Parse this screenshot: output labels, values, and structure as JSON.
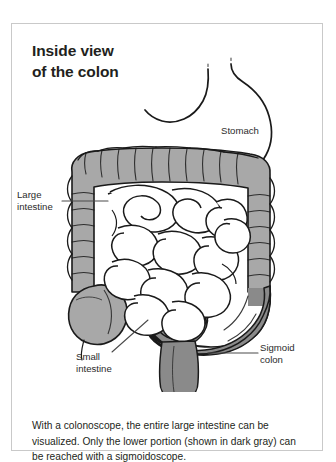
{
  "figure": {
    "title": "Inside view\nof the colon",
    "caption": "With a colonoscope, the entire large intestine can be visualized. Only the lower portion (shown in dark gray) can be reached with a sigmoidoscope.",
    "border_color": "#c9c9c9",
    "background_color": "#ffffff"
  },
  "labels": {
    "stomach": "Stomach",
    "large_intestine": "Large\nintestine",
    "small_intestine": "Small\nintestine",
    "sigmoid_colon": "Sigmoid\ncolon"
  },
  "colors": {
    "colon_light_gray": "#a8a8a8",
    "colon_dark_gray": "#8a8a8a",
    "outline": "#1a1a1a",
    "leader_line": "#4a4a4a",
    "text": "#231f20",
    "small_intestine_fill": "#ffffff",
    "stomach_fill": "#ffffff"
  },
  "anatomy": {
    "parts": [
      {
        "name": "stomach",
        "fill": "white",
        "description": "J-shaped outlined organ upper right"
      },
      {
        "name": "transverse-colon",
        "fill": "light-gray",
        "description": "horizontal haustrated segment across the top"
      },
      {
        "name": "ascending-colon",
        "fill": "light-gray",
        "description": "vertical segment on the left"
      },
      {
        "name": "cecum",
        "fill": "light-gray",
        "description": "rounded bulb at lower left"
      },
      {
        "name": "descending-colon",
        "fill": "light-gray",
        "description": "vertical segment on the right"
      },
      {
        "name": "sigmoid-colon",
        "fill": "dark-gray",
        "description": "S-curve at lower right, reachable by sigmoidoscope"
      },
      {
        "name": "rectum",
        "fill": "dark-gray",
        "description": "tapering descending tube at bottom center"
      },
      {
        "name": "small-intestine",
        "fill": "white",
        "description": "coiled loops filling the center"
      }
    ]
  }
}
